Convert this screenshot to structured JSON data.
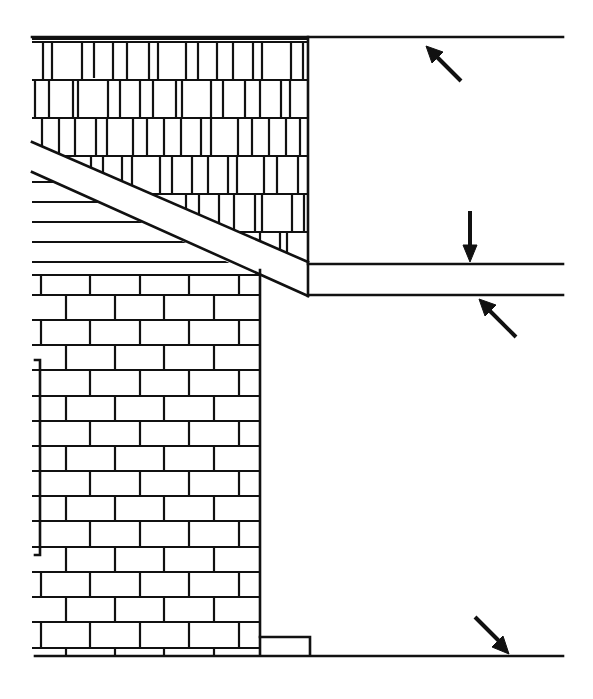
{
  "diagram": {
    "type": "architectural-elevation-detail",
    "colors": {
      "line": "#111111",
      "background": "#ffffff"
    },
    "elements": {
      "shingle_siding": {
        "label": ""
      },
      "lap_siding": {
        "label": ""
      },
      "brick_veneer": {
        "label": ""
      },
      "fascia_rake": {
        "label": ""
      },
      "soffit": {
        "label": ""
      },
      "ground_line": {
        "label": ""
      }
    },
    "arrows": [
      {
        "id": "arrow-top-line",
        "direction": "up-left",
        "target": "top reference line"
      },
      {
        "id": "arrow-soffit-top",
        "direction": "down",
        "target": "soffit upper line"
      },
      {
        "id": "arrow-soffit-bottom",
        "direction": "up-left",
        "target": "soffit lower line"
      },
      {
        "id": "arrow-ground",
        "direction": "down-right",
        "target": "ground line"
      }
    ]
  }
}
